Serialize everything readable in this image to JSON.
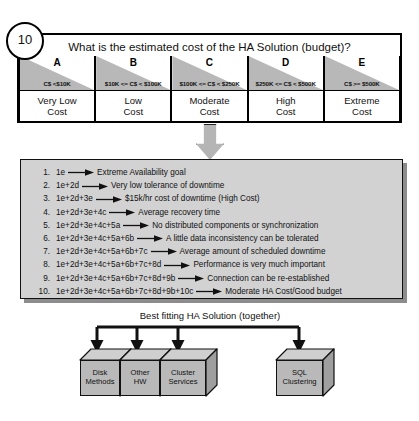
{
  "badge": {
    "number": "10"
  },
  "question": {
    "title": "What is the estimated cost of the HA Solution (budget)?"
  },
  "scale": {
    "columns": [
      {
        "letter": "A",
        "range": "C$ <$10K",
        "cost": "Very Low\nCost"
      },
      {
        "letter": "B",
        "range": "$10K <= C$  < $100K",
        "cost": "Low\nCost"
      },
      {
        "letter": "C",
        "range": "$100K <= C$ < $250K",
        "cost": "Moderate\nCost"
      },
      {
        "letter": "D",
        "range": "$250K <= C$ < $500K",
        "cost": "High\nCost"
      },
      {
        "letter": "E",
        "range": "C$ >= $500K",
        "cost": "Extreme\nCost"
      }
    ]
  },
  "flow_arrow": {
    "icon": "down-block-arrow-icon"
  },
  "summary_list": {
    "items": [
      {
        "num": "1.",
        "expression": "1e",
        "result": "Extreme Availability goal"
      },
      {
        "num": "2.",
        "expression": "1e+2d",
        "result": "Very low tolerance of downtime"
      },
      {
        "num": "3.",
        "expression": "1e+2d+3e",
        "result": "$15k/hr cost of downtime (High Cost)"
      },
      {
        "num": "4.",
        "expression": "1e+2d+3e+4c",
        "result": "Average recovery time"
      },
      {
        "num": "5.",
        "expression": "1e+2d+3e+4c+5a",
        "result": "No distributed components or synchronization"
      },
      {
        "num": "6.",
        "expression": "1e+2d+3e+4c+5a+6b",
        "result": "A little data inconsistency can be tolerated"
      },
      {
        "num": "7.",
        "expression": "1e+2d+3e+4c+5a+6b+7c",
        "result": "Average amount of scheduled downtime"
      },
      {
        "num": "8.",
        "expression": "1e+2d+3e+4c+5a+6b+7c+8d",
        "result": "Performance is very much important"
      },
      {
        "num": "9.",
        "expression": "1e+2d+3e+4c+5a+6b+7c+8d+9b",
        "result": "Connection can be re-established"
      },
      {
        "num": "10.",
        "expression": "1e+2d+3e+4c+5a+6b+7c+8d+9b+10c",
        "result": "Moderate HA Cost/Good budget"
      }
    ]
  },
  "solution": {
    "caption": "Best fitting HA Solution (together)",
    "boxes": [
      {
        "label": "Disk\nMethods"
      },
      {
        "label": "Other\nHW"
      },
      {
        "label": "Cluster\nServices"
      },
      {
        "label": "SQL\nClustering"
      }
    ]
  },
  "colors": {
    "shade_gray": "#b8b8b8",
    "panel_gray": "#d2d2d2",
    "cube_gray": "#b9b9b9",
    "outline": "#111111"
  }
}
